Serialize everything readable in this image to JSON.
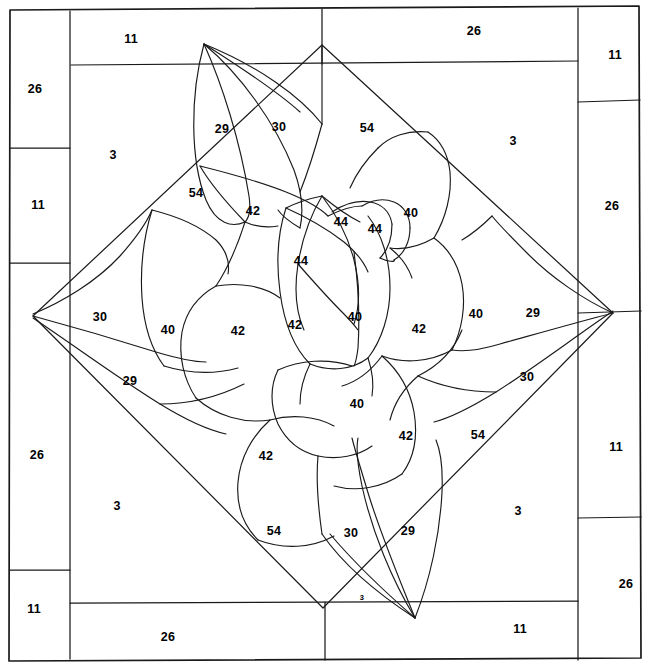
{
  "document": {
    "title": "Quilt Block Pattern Diagram",
    "subject": "rose-applique-quilt-block",
    "description": "Line-art piecing diagram of a stylized rose inside a diamond field with a pieced outer border",
    "colors": {
      "background": "#ffffff",
      "line": "#1a1a1a",
      "text": "#000000"
    },
    "line_weight": {
      "frame": 1.6,
      "border": 1.2,
      "petal": 1.1
    }
  },
  "border": {
    "name": "pieced-outer-border",
    "top_strips": [
      {
        "label": "11",
        "x": 131,
        "y": 39
      },
      {
        "label": "26",
        "x": 474,
        "y": 31
      }
    ],
    "bottom_strips": [
      {
        "label": "26",
        "x": 168,
        "y": 637
      },
      {
        "label": "11",
        "x": 520,
        "y": 629
      }
    ],
    "left_strips": [
      {
        "label": "26",
        "x": 35,
        "y": 89
      },
      {
        "label": "11",
        "x": 38,
        "y": 205
      },
      {
        "label": "26",
        "x": 37,
        "y": 455
      },
      {
        "label": "11",
        "x": 34,
        "y": 609
      }
    ],
    "right_strips": [
      {
        "label": "11",
        "x": 615,
        "y": 55
      },
      {
        "label": "26",
        "x": 612,
        "y": 206
      },
      {
        "label": "11",
        "x": 616,
        "y": 447
      },
      {
        "label": "26",
        "x": 626,
        "y": 584
      }
    ]
  },
  "background_field": {
    "name": "corner-background-triangles",
    "labels": [
      {
        "label": "3",
        "x": 113,
        "y": 155
      },
      {
        "label": "3",
        "x": 513,
        "y": 141
      },
      {
        "label": "3",
        "x": 117,
        "y": 506
      },
      {
        "label": "3",
        "x": 518,
        "y": 511
      },
      {
        "label": "3",
        "x": 362,
        "y": 598,
        "size": "tiny"
      }
    ]
  },
  "diamond_field": {
    "name": "on-point-diamond-field",
    "labels": [
      {
        "label": "54",
        "x": 367,
        "y": 128
      },
      {
        "label": "54",
        "x": 196,
        "y": 193
      },
      {
        "label": "54",
        "x": 274,
        "y": 531
      },
      {
        "label": "54",
        "x": 478,
        "y": 435
      }
    ]
  },
  "rose": {
    "name": "applique-rose-motif",
    "outer_leaves": [
      {
        "label": "29",
        "x": 222,
        "y": 129
      },
      {
        "label": "30",
        "x": 279,
        "y": 127
      },
      {
        "label": "30",
        "x": 100,
        "y": 317
      },
      {
        "label": "29",
        "x": 130,
        "y": 381
      },
      {
        "label": "29",
        "x": 533,
        "y": 313
      },
      {
        "label": "30",
        "x": 527,
        "y": 377
      },
      {
        "label": "30",
        "x": 351,
        "y": 533
      },
      {
        "label": "29",
        "x": 408,
        "y": 531
      }
    ],
    "petals": [
      {
        "label": "42",
        "x": 253,
        "y": 211
      },
      {
        "label": "44",
        "x": 341,
        "y": 222
      },
      {
        "label": "44",
        "x": 375,
        "y": 229
      },
      {
        "label": "40",
        "x": 411,
        "y": 213
      },
      {
        "label": "44",
        "x": 301,
        "y": 261
      },
      {
        "label": "40",
        "x": 355,
        "y": 317
      },
      {
        "label": "42",
        "x": 295,
        "y": 325
      },
      {
        "label": "42",
        "x": 238,
        "y": 331
      },
      {
        "label": "40",
        "x": 168,
        "y": 330
      },
      {
        "label": "42",
        "x": 419,
        "y": 329
      },
      {
        "label": "40",
        "x": 476,
        "y": 314
      },
      {
        "label": "40",
        "x": 357,
        "y": 404
      },
      {
        "label": "42",
        "x": 266,
        "y": 456
      },
      {
        "label": "42",
        "x": 406,
        "y": 436
      }
    ]
  },
  "legend": {
    "piece_numbers": [
      "3",
      "11",
      "26",
      "29",
      "30",
      "40",
      "42",
      "44",
      "54"
    ]
  }
}
